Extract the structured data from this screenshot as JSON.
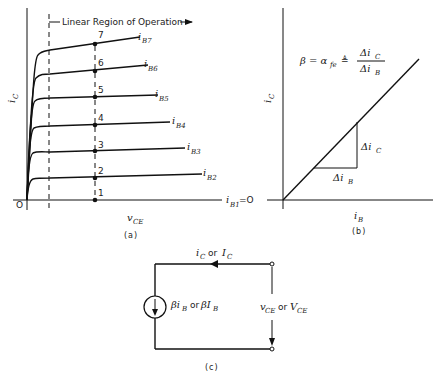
{
  "panel_a": {
    "caption": "(a)",
    "y_axis_label": "i",
    "y_axis_sub": "C",
    "x_axis_label": "v",
    "x_axis_sub": "CE",
    "origin_label": "O",
    "region_label": "Linear Region of Operation",
    "curves": [
      {
        "label": "i",
        "sub": "B7"
      },
      {
        "label": "i",
        "sub": "B6"
      },
      {
        "label": "i",
        "sub": "B5"
      },
      {
        "label": "i",
        "sub": "B4"
      },
      {
        "label": "i",
        "sub": "B3"
      },
      {
        "label": "i",
        "sub": "B2"
      },
      {
        "label": "i",
        "sub": "B1",
        "suffix": "=O"
      }
    ],
    "points": [
      "7",
      "6",
      "5",
      "4",
      "3",
      "2",
      "1"
    ]
  },
  "panel_b": {
    "caption": "(b)",
    "y_axis_label": "i",
    "y_axis_sub": "C",
    "x_axis_label": "i",
    "x_axis_sub": "B",
    "formula_lhs": "β = α",
    "formula_lhs_sub": "fe",
    "formula_def": "≜",
    "formula_num": "Δi",
    "formula_num_sub": "C",
    "formula_den": "Δi",
    "formula_den_sub": "B",
    "delta_ic": "Δi",
    "delta_ic_sub": "C",
    "delta_ib": "Δi",
    "delta_ib_sub": "B"
  },
  "panel_c": {
    "caption": "(c)",
    "current_label": "i",
    "current_sub": "C",
    "current_or": "or",
    "current_dc": "I",
    "current_dc_sub": "C",
    "source_label": "βi",
    "source_sub": "B",
    "source_or": "or",
    "source_dc": "βI",
    "source_dc_sub": "B",
    "voltage_label": "v",
    "voltage_sub": "CE",
    "voltage_or": "or",
    "voltage_dc": "V",
    "voltage_dc_sub": "CE"
  }
}
